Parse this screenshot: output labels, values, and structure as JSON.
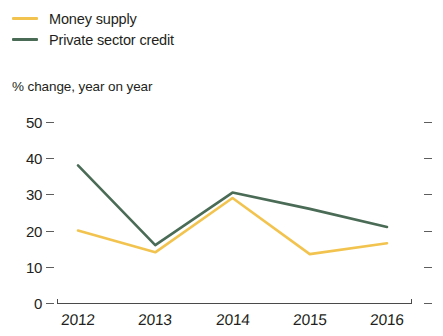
{
  "legend": {
    "position": "top-left",
    "entries": [
      {
        "label": "Money supply",
        "color": "#F2C44F"
      },
      {
        "label": "Private sector credit",
        "color": "#4A6B55"
      }
    ]
  },
  "axis_subtitle": "% change, year on year",
  "chart_data": {
    "type": "line",
    "title": "",
    "subtitle": "% change, year on year",
    "xlabel": "",
    "ylabel": "% change, year on year",
    "categories": [
      "2012",
      "2013",
      "2014",
      "2015",
      "2016"
    ],
    "x": [
      2012,
      2013,
      2014,
      2015,
      2016
    ],
    "series": [
      {
        "name": "Money supply",
        "color": "#F2C44F",
        "values": [
          20,
          14,
          29,
          13.5,
          16.5
        ]
      },
      {
        "name": "Private sector credit",
        "color": "#4A6B55",
        "values": [
          38,
          16,
          30.5,
          26,
          21
        ]
      }
    ],
    "ylim": [
      0,
      50
    ],
    "yticks": [
      0,
      10,
      20,
      30,
      40,
      50
    ],
    "ytick_labels": [
      "0",
      "10",
      "20",
      "30",
      "40",
      "50"
    ],
    "xtick_labels": [
      "2012",
      "2013",
      "2014",
      "2015",
      "2016"
    ],
    "grid": false,
    "legend_position": "top-left",
    "right_axis_ticks": true
  }
}
